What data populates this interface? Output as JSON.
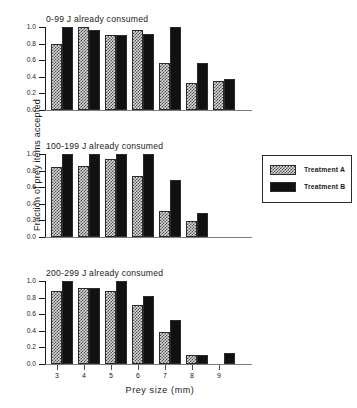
{
  "chart_data": {
    "type": "bar",
    "title": "",
    "xlabel": "Prey size (mm)",
    "ylabel": "Fraction of prey items accepted",
    "categories": [
      "3",
      "4",
      "5",
      "6",
      "7",
      "8",
      "9"
    ],
    "ylim": [
      0.0,
      1.0
    ],
    "yticks": [
      "0.0",
      "0.2",
      "0.4",
      "0.6",
      "0.8",
      "1.0"
    ],
    "grid": false,
    "legend_position": "right-of-middle-panel",
    "legend": [
      {
        "name": "Treatment A",
        "style": "checkered-gray",
        "color": "#d8d8d8"
      },
      {
        "name": "Treatment B",
        "style": "solid-black",
        "color": "#111111"
      }
    ],
    "panels": [
      {
        "title": "0-99 J already consumed",
        "series": [
          {
            "name": "Treatment A",
            "values": [
              0.8,
              1.0,
              0.9,
              0.96,
              0.57,
              0.33,
              0.35
            ]
          },
          {
            "name": "Treatment B",
            "values": [
              1.0,
              0.96,
              0.9,
              0.92,
              1.0,
              0.57,
              0.37
            ]
          }
        ]
      },
      {
        "title": "100-199 J already consumed",
        "series": [
          {
            "name": "Treatment A",
            "values": [
              0.84,
              0.86,
              0.94,
              0.73,
              0.31,
              0.19,
              0.0
            ]
          },
          {
            "name": "Treatment B",
            "values": [
              1.0,
              1.0,
              1.0,
              1.0,
              0.69,
              0.29,
              0.0
            ]
          }
        ]
      },
      {
        "title": "200-299 J already consumed",
        "series": [
          {
            "name": "Treatment A",
            "values": [
              0.88,
              0.92,
              0.88,
              0.71,
              0.38,
              0.11,
              0.0
            ]
          },
          {
            "name": "Treatment B",
            "values": [
              1.0,
              0.92,
              1.0,
              0.82,
              0.53,
              0.11,
              0.13
            ]
          }
        ]
      }
    ]
  }
}
